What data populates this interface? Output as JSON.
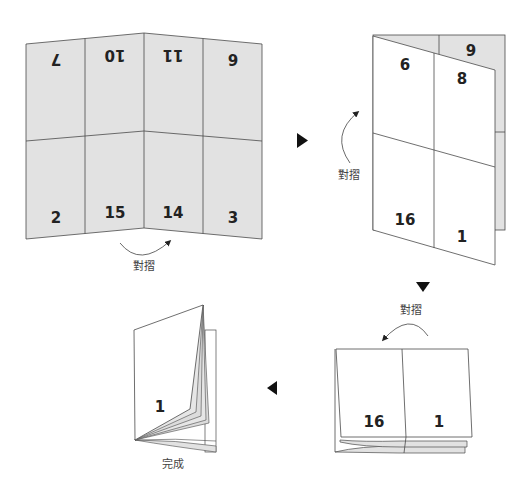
{
  "colors": {
    "paper_back": "#e2e2e2",
    "paper_front": "#ffffff",
    "line": "#4a4a4a",
    "arrow": "#111111",
    "text": "#222222"
  },
  "step1": {
    "top_row_pages_upside_down": [
      "7",
      "10",
      "11",
      "6"
    ],
    "bottom_row_pages": [
      "2",
      "15",
      "14",
      "3"
    ],
    "fold_label": "對摺"
  },
  "step2": {
    "front_pages": [
      "6",
      "8",
      "16",
      "1"
    ],
    "back_page": "9",
    "fold_label": "對摺"
  },
  "step3": {
    "front_pages": [
      "16",
      "1"
    ],
    "fold_label": "對摺"
  },
  "step4": {
    "cover_page": "1",
    "label": "完成"
  },
  "arrows": [
    "right",
    "down",
    "left"
  ]
}
